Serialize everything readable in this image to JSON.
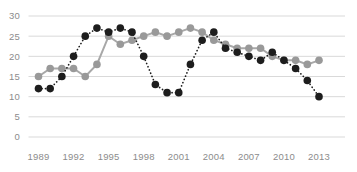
{
  "chart_data": {
    "type": "line",
    "x": [
      1989,
      1990,
      1991,
      1992,
      1993,
      1994,
      1995,
      1996,
      1997,
      1998,
      1999,
      2000,
      2001,
      2002,
      2003,
      2004,
      2005,
      2006,
      2007,
      2008,
      2009,
      2010,
      2011,
      2012,
      2013
    ],
    "series": [
      {
        "name": "gray-solid-series",
        "color": "#999999",
        "line_color": "#a8a8a8",
        "line_style": "solid",
        "values": [
          15,
          17,
          17,
          17,
          15,
          18,
          25,
          23,
          24,
          25,
          26,
          25,
          26,
          27,
          26,
          24,
          23,
          22,
          22,
          22,
          20,
          19,
          19,
          18,
          19
        ]
      },
      {
        "name": "black-dotted-series",
        "color": "#1d1d1d",
        "line_color": "#1d1d1d",
        "line_style": "dotted",
        "values": [
          12,
          12,
          15,
          20,
          25,
          27,
          26,
          27,
          26,
          20,
          13,
          11,
          11,
          18,
          24,
          26,
          22,
          21,
          20,
          19,
          21,
          19,
          17,
          14,
          10
        ]
      }
    ],
    "xlabel": "",
    "ylabel": "",
    "ylim": [
      0,
      30
    ],
    "y_ticks": [
      0,
      5,
      10,
      15,
      20,
      25,
      30
    ],
    "x_tick_labels": [
      "1989",
      "1992",
      "1995",
      "1998",
      "2001",
      "2004",
      "2007",
      "2010",
      "2013"
    ],
    "grid": true,
    "legend_position": "none",
    "axis_label_color": "#8c8c8c",
    "gridline_color": "#d9d9d9",
    "background_color": "#ffffff"
  }
}
